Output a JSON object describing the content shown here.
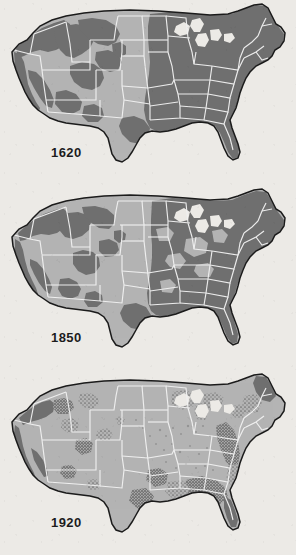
{
  "figure": {
    "background_color": "#eceae6"
  },
  "palette": {
    "forest": "#6f6f6f",
    "forest_dark": "#5e5e5e",
    "cleared_land": "#b4b4b4",
    "state_border": "#f2f2f2",
    "coastline": "#1b1b1b",
    "lake": "#eceae6",
    "label_text": "#1c1c1c"
  },
  "panels": [
    {
      "id": "panel-1620",
      "year": "1620",
      "label_position": {
        "x": 51,
        "y": 145
      },
      "forest_description": "Nearly continuous virgin forest covering the entire eastern United States, the Great Lakes states and the Pacific Northwest, with large blocks in the Rocky Mountains and Sierra Nevada.",
      "forest_coverage_level": "high"
    },
    {
      "id": "panel-1850",
      "year": "1850",
      "label_position": {
        "x": 51,
        "y": 330
      },
      "forest_description": "Eastern forest still largely intact but thinning in the Ohio Valley and middle Atlantic states; western mountain forests reduced to narrower bands.",
      "forest_coverage_level": "medium"
    },
    {
      "id": "panel-1920",
      "year": "1920",
      "label_position": {
        "x": 51,
        "y": 515
      },
      "forest_description": "Virgin forest reduced to scattered fragments: remnants in northern Maine, the southern Appalachians, the Gulf coastal plain, the Ozarks, the Pacific coast ranges and the northern Rockies.",
      "forest_coverage_level": "low"
    }
  ],
  "chart_data": {
    "type": "map",
    "categories": [
      "1620",
      "1850",
      "1920"
    ],
    "series": [
      {
        "name": "Virgin forest extent (relative)",
        "values": [
          100,
          72,
          18
        ]
      }
    ],
    "legend": [],
    "regions": [
      {
        "name": "Northeast / New England",
        "1620": "forested",
        "1850": "forested",
        "1920": "fragmented"
      },
      {
        "name": "Great Lakes",
        "1620": "forested",
        "1850": "forested",
        "1920": "fragmented"
      },
      {
        "name": "Appalachians / Southeast",
        "1620": "forested",
        "1850": "forested",
        "1920": "fragmented"
      },
      {
        "name": "Gulf Coastal Plain",
        "1620": "forested",
        "1850": "forested",
        "1920": "fragmented"
      },
      {
        "name": "Ozarks",
        "1620": "forested",
        "1850": "forested",
        "1920": "fragmented"
      },
      {
        "name": "Great Plains",
        "1620": "cleared",
        "1850": "cleared",
        "1920": "cleared"
      },
      {
        "name": "Rocky Mountains",
        "1620": "forested",
        "1850": "partial",
        "1920": "fragmented"
      },
      {
        "name": "Pacific Northwest",
        "1620": "forested",
        "1850": "forested",
        "1920": "partial"
      },
      {
        "name": "Sierra Nevada / Coast Ranges",
        "1620": "forested",
        "1850": "partial",
        "1920": "fragmented"
      },
      {
        "name": "Florida Peninsula",
        "1620": "forested",
        "1850": "forested",
        "1920": "partial"
      }
    ],
    "xlabel": "",
    "ylabel": ""
  }
}
